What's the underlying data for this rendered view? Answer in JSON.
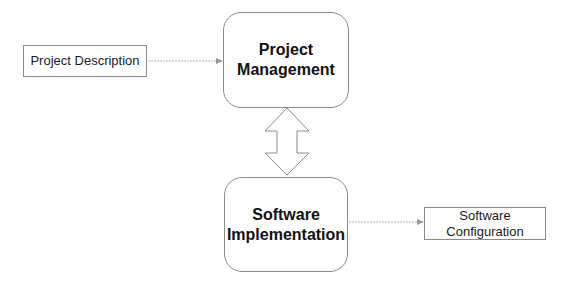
{
  "diagram": {
    "nodes": [
      {
        "id": "project-description",
        "label": "Project Description",
        "shape": "rectangle"
      },
      {
        "id": "project-management",
        "label": "Project\nManagement",
        "shape": "rounded-rectangle"
      },
      {
        "id": "software-implementation",
        "label": "Software\nImplementation",
        "shape": "rounded-rectangle"
      },
      {
        "id": "software-configuration",
        "label": "Software\nConfiguration",
        "shape": "rectangle"
      }
    ],
    "edges": [
      {
        "from": "project-description",
        "to": "project-management",
        "type": "arrow"
      },
      {
        "from": "project-management",
        "to": "software-implementation",
        "type": "double-block-arrow"
      },
      {
        "from": "software-implementation",
        "to": "software-configuration",
        "type": "arrow"
      }
    ],
    "colors": {
      "border": "#8a8a8a",
      "arrow": "#a0a0a0",
      "text": "#111111"
    }
  }
}
